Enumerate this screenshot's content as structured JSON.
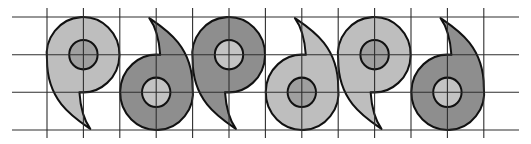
{
  "title": "Alternating comma (magatama) tessellation on grid",
  "colors": {
    "background": "#ffffff",
    "grid": "#2e2e2e",
    "outline": "#111111",
    "light_fill": "#bebebe",
    "light_inner": "#9f9f9f",
    "dark_fill": "#8e8e8e",
    "dark_inner": "#c3c3c3"
  },
  "grid": {
    "vertical_x": [
      47,
      83.4,
      119.8,
      156.2,
      192.6,
      229,
      265.4,
      301.8,
      338.2,
      374.6,
      411,
      447.4,
      483.8
    ],
    "vertical_y_range": [
      8,
      138
    ],
    "horizontal_y": [
      17,
      54.7,
      92.3,
      130
    ],
    "horizontal_x_range": [
      12,
      519
    ]
  },
  "shape_geometry": {
    "unit": "outer ring radius = 1 grid cell",
    "inner_circle_radius_ratio": 0.39,
    "tail_tip_offset_cells": [
      0.19,
      1.97
    ]
  },
  "shapes": [
    {
      "id": 1,
      "orientation": "head-up",
      "tone": "light",
      "center": [
        83.4,
        54.7
      ]
    },
    {
      "id": 2,
      "orientation": "head-down",
      "tone": "dark",
      "center": [
        156.2,
        92.3
      ]
    },
    {
      "id": 3,
      "orientation": "head-up",
      "tone": "dark",
      "center": [
        229,
        54.7
      ]
    },
    {
      "id": 4,
      "orientation": "head-down",
      "tone": "light",
      "center": [
        301.8,
        92.3
      ]
    },
    {
      "id": 5,
      "orientation": "head-up",
      "tone": "light",
      "center": [
        374.6,
        54.7
      ]
    },
    {
      "id": 6,
      "orientation": "head-down",
      "tone": "dark",
      "center": [
        447.4,
        92.3
      ]
    }
  ]
}
